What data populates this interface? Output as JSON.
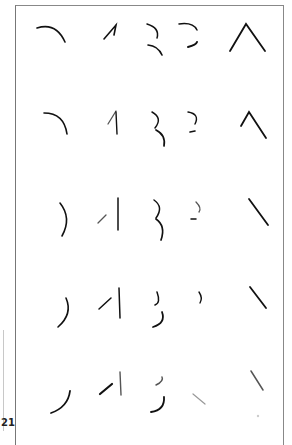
{
  "page": {
    "number": "21"
  },
  "plate": {
    "rows": 5,
    "columns": 5,
    "description": "Grid of partial stroke fragments of glyphs, progressively fragmented from top row to bottom row",
    "row_glyphs": [
      [
        "arc",
        "one",
        "three",
        "reversed-c",
        "caret"
      ],
      [
        "arc",
        "one",
        "three",
        "reversed-c",
        "caret"
      ],
      [
        "right-paren",
        "slash-bar",
        "three",
        "reversed-c",
        "backslash"
      ],
      [
        "right-paren",
        "slash-bar",
        "three",
        "right-paren-small",
        "backslash"
      ],
      [
        "right-paren",
        "slash-bar",
        "three",
        "backslash-faint",
        "backslash"
      ]
    ]
  },
  "colors": {
    "ink": "#111111",
    "frame": "#888888",
    "background": "#ffffff"
  }
}
